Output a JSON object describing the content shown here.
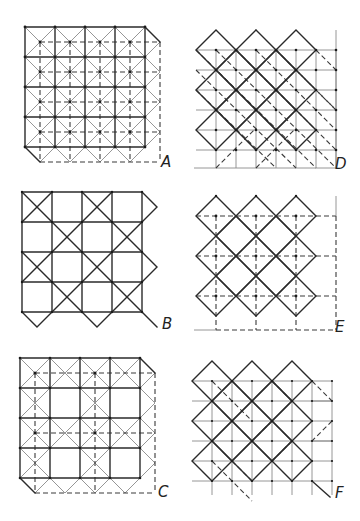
{
  "figure": {
    "panels": [
      {
        "id": "A",
        "label": "A",
        "type": "square-grid-with-diagonals-and-offset-dashed-grid"
      },
      {
        "id": "B",
        "label": "B",
        "type": "square-grid-with-checkerboard-crosses"
      },
      {
        "id": "C",
        "label": "C",
        "type": "square-grid-with-partial-diagonals-and-offset-dashed-grid"
      },
      {
        "id": "D",
        "label": "D",
        "type": "diamond-lattice-with-square-grid-and-dashed-diagonals"
      },
      {
        "id": "E",
        "label": "E",
        "type": "diamond-lattice-with-dashed-square-grid"
      },
      {
        "id": "F",
        "label": "F",
        "type": "diamond-lattice-with-offset-square-grid-and-dashed-diagonals"
      }
    ]
  },
  "colors": {
    "background": "#ffffff",
    "line_solid": "#2a2a2a",
    "line_thin": "#8a8a8a",
    "line_dashed": "#3a3a3a"
  }
}
